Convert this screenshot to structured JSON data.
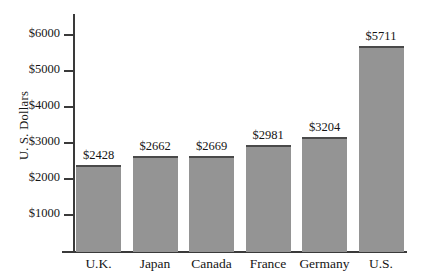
{
  "chart_data": {
    "type": "bar",
    "title": "",
    "xlabel": "",
    "ylabel": "U. S. Dollars",
    "categories": [
      "U.K.",
      "Japan",
      "Canada",
      "France",
      "Germany",
      "U.S."
    ],
    "values": [
      2428,
      2662,
      2669,
      2981,
      3204,
      5711
    ],
    "value_labels": [
      "$2428",
      "$2662",
      "$2669",
      "$2981",
      "$3204",
      "$5711"
    ],
    "ytick_values": [
      1000,
      2000,
      3000,
      4000,
      5000,
      6000
    ],
    "ytick_labels": [
      "$1000",
      "$2000",
      "$3000",
      "$4000",
      "$5000",
      "$6000"
    ],
    "ylim": [
      0,
      6620
    ],
    "grid": false,
    "legend": null,
    "bar_color": "#949494",
    "bar_edge_color": "#4a4a4a",
    "axis_color": "#3a3a3a",
    "background_color": "#ffffff",
    "text_color": "#151515"
  }
}
